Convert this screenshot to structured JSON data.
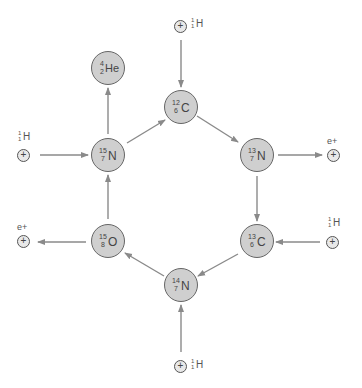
{
  "diagram": {
    "colors": {
      "nucleus_fill": "#cfcfcf",
      "nucleus_stroke": "#666666",
      "arrow": "#8a8a8a",
      "particle_fill": "#e8e8e8"
    },
    "nuclei": [
      {
        "id": "c12",
        "mass": "12",
        "z": "6",
        "symbol": "C"
      },
      {
        "id": "n13",
        "mass": "13",
        "z": "7",
        "symbol": "N"
      },
      {
        "id": "c13",
        "mass": "13",
        "z": "6",
        "symbol": "C"
      },
      {
        "id": "n14",
        "mass": "14",
        "z": "7",
        "symbol": "N"
      },
      {
        "id": "o15",
        "mass": "15",
        "z": "8",
        "symbol": "O"
      },
      {
        "id": "n15",
        "mass": "15",
        "z": "7",
        "symbol": "N"
      },
      {
        "id": "he4",
        "mass": "4",
        "z": "2",
        "symbol": "He"
      }
    ],
    "particles": {
      "plus_glyph": "+",
      "proton": {
        "mass": "1",
        "z": "1",
        "symbol": "H"
      },
      "positron": {
        "label": "e+"
      }
    },
    "edges": [
      {
        "from": "proton-top",
        "to": "c12"
      },
      {
        "from": "c12",
        "to": "n13"
      },
      {
        "from": "n13",
        "to": "positron-right"
      },
      {
        "from": "n13",
        "to": "c13"
      },
      {
        "from": "proton-right",
        "to": "c13"
      },
      {
        "from": "c13",
        "to": "n14"
      },
      {
        "from": "proton-bottom",
        "to": "n14"
      },
      {
        "from": "n14",
        "to": "o15"
      },
      {
        "from": "o15",
        "to": "positron-left"
      },
      {
        "from": "o15",
        "to": "n15"
      },
      {
        "from": "proton-left",
        "to": "n15"
      },
      {
        "from": "n15",
        "to": "c12"
      },
      {
        "from": "n15",
        "to": "he4"
      }
    ]
  }
}
